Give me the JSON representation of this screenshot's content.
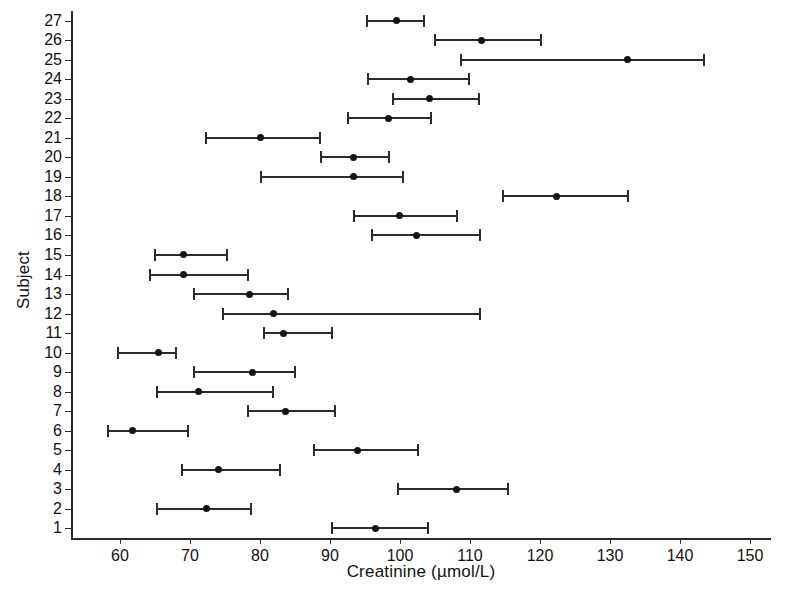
{
  "chart_data": {
    "type": "scatter",
    "subtype": "confidence-interval-dot-plot",
    "title": "",
    "xlabel": "Creatinine (µmol/L)",
    "ylabel": "Subject",
    "xlim": [
      53,
      153
    ],
    "xticks": [
      60,
      70,
      80,
      90,
      100,
      110,
      120,
      130,
      140,
      150
    ],
    "xticklabels": [
      "60",
      "70",
      "80",
      "90",
      "100",
      "110",
      "120",
      "130",
      "140",
      "150"
    ],
    "ylim": [
      0.5,
      27.5
    ],
    "yticks": [
      1,
      2,
      3,
      4,
      5,
      6,
      7,
      8,
      9,
      10,
      11,
      12,
      13,
      14,
      15,
      16,
      17,
      18,
      19,
      20,
      21,
      22,
      23,
      24,
      25,
      26,
      27
    ],
    "yticklabels": [
      "1",
      "2",
      "3",
      "4",
      "5",
      "6",
      "7",
      "8",
      "9",
      "10",
      "11",
      "12",
      "13",
      "14",
      "15",
      "16",
      "17",
      "18",
      "19",
      "20",
      "21",
      "22",
      "23",
      "24",
      "25",
      "26",
      "27"
    ],
    "grid": false,
    "legend": null,
    "marker_color": "#141414",
    "line_color": "#2b2b2b",
    "axis_color": "#2a2a2a",
    "categories": [
      "1",
      "2",
      "3",
      "4",
      "5",
      "6",
      "7",
      "8",
      "9",
      "10",
      "11",
      "12",
      "13",
      "14",
      "15",
      "16",
      "17",
      "18",
      "19",
      "20",
      "21",
      "22",
      "23",
      "24",
      "25",
      "26",
      "27"
    ],
    "points": [
      {
        "subject": 1,
        "mean": 96.5,
        "lower": 90.1,
        "upper": 104.2
      },
      {
        "subject": 2,
        "mean": 72.3,
        "lower": 65.2,
        "upper": 78.8
      },
      {
        "subject": 3,
        "mean": 108.1,
        "lower": 99.5,
        "upper": 115.6
      },
      {
        "subject": 4,
        "mean": 74.0,
        "lower": 68.7,
        "upper": 83.0
      },
      {
        "subject": 5,
        "mean": 93.9,
        "lower": 87.6,
        "upper": 102.7
      },
      {
        "subject": 6,
        "mean": 61.8,
        "lower": 58.1,
        "upper": 69.9
      },
      {
        "subject": 7,
        "mean": 83.6,
        "lower": 78.2,
        "upper": 90.9
      },
      {
        "subject": 8,
        "mean": 71.2,
        "lower": 65.2,
        "upper": 82.0
      },
      {
        "subject": 9,
        "mean": 78.9,
        "lower": 70.4,
        "upper": 85.2
      },
      {
        "subject": 10,
        "mean": 65.5,
        "lower": 59.5,
        "upper": 68.1
      },
      {
        "subject": 11,
        "mean": 83.3,
        "lower": 80.4,
        "upper": 90.4
      },
      {
        "subject": 12,
        "mean": 81.9,
        "lower": 74.6,
        "upper": 111.6
      },
      {
        "subject": 13,
        "mean": 78.5,
        "lower": 70.4,
        "upper": 84.1
      },
      {
        "subject": 14,
        "mean": 69.1,
        "lower": 64.1,
        "upper": 78.4
      },
      {
        "subject": 15,
        "mean": 69.1,
        "lower": 64.8,
        "upper": 75.4
      },
      {
        "subject": 16,
        "mean": 102.4,
        "lower": 95.9,
        "upper": 111.6
      },
      {
        "subject": 17,
        "mean": 99.9,
        "lower": 93.3,
        "upper": 108.3
      },
      {
        "subject": 18,
        "mean": 122.4,
        "lower": 114.5,
        "upper": 132.7
      },
      {
        "subject": 19,
        "mean": 93.4,
        "lower": 80.0,
        "upper": 100.5
      },
      {
        "subject": 20,
        "mean": 93.4,
        "lower": 88.6,
        "upper": 98.6
      },
      {
        "subject": 21,
        "mean": 80.1,
        "lower": 72.1,
        "upper": 88.7
      },
      {
        "subject": 22,
        "mean": 98.4,
        "lower": 92.4,
        "upper": 104.5
      },
      {
        "subject": 23,
        "mean": 104.2,
        "lower": 98.9,
        "upper": 111.4
      },
      {
        "subject": 24,
        "mean": 101.5,
        "lower": 95.3,
        "upper": 110.0
      },
      {
        "subject": 25,
        "mean": 132.5,
        "lower": 108.6,
        "upper": 143.5
      },
      {
        "subject": 26,
        "mean": 111.7,
        "lower": 104.8,
        "upper": 120.3
      },
      {
        "subject": 27,
        "mean": 99.5,
        "lower": 95.2,
        "upper": 103.5
      }
    ]
  }
}
